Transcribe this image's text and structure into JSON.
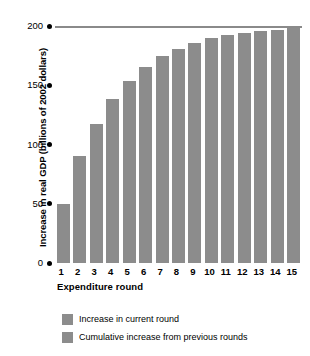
{
  "chart_data": {
    "type": "bar",
    "title": "",
    "subtitle": "",
    "xlabel": "Expenditure round",
    "ylabel": "Increase in real GDP (billions of 2002 dollars)",
    "categories": [
      "1",
      "2",
      "3",
      "4",
      "5",
      "6",
      "7",
      "8",
      "9",
      "10",
      "11",
      "12",
      "13",
      "14",
      "15"
    ],
    "values": [
      50,
      90,
      117,
      138,
      154,
      165,
      175,
      181,
      186,
      190,
      192,
      194,
      196,
      197,
      198
    ],
    "series": [
      {
        "name": "Increase in current round",
        "values": [
          50,
          40,
          27,
          21,
          16,
          11,
          10,
          6,
          5,
          4,
          2,
          2,
          2,
          1,
          1
        ]
      },
      {
        "name": "Cumulative increase from previous rounds",
        "values": [
          0,
          50,
          90,
          117,
          138,
          154,
          165,
          175,
          181,
          186,
          190,
          192,
          194,
          196,
          197
        ]
      }
    ],
    "ylim": [
      0,
      200
    ],
    "yticks": [
      0,
      50,
      100,
      150,
      200
    ],
    "ytick_labels": [
      "0",
      "50",
      "100",
      "150",
      "200"
    ],
    "grid": false,
    "reference_line": 200,
    "legend_position": "bottom-left",
    "bar_color": "#8c8c8c",
    "reference_line_color": "#8a8a8a"
  },
  "legend": {
    "entries": [
      {
        "label": "Increase in current round",
        "color": "#8c8c8c"
      },
      {
        "label": "Cumulative increase from previous rounds",
        "color": "#8c8c8c"
      }
    ]
  }
}
